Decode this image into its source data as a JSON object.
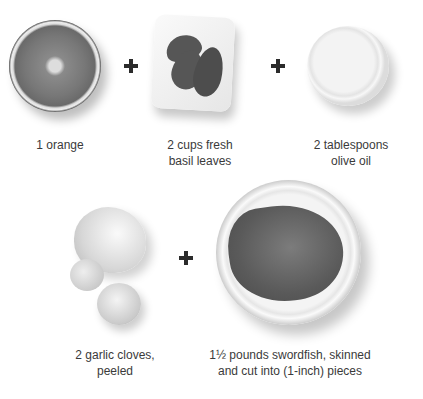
{
  "ingredients": [
    {
      "name": "orange",
      "label_lines": [
        "1 orange"
      ]
    },
    {
      "name": "basil",
      "label_lines": [
        "2 cups fresh",
        "basil leaves"
      ]
    },
    {
      "name": "olive-oil",
      "label_lines": [
        "2 tablespoons",
        "olive oil"
      ]
    },
    {
      "name": "garlic",
      "label_lines": [
        "2 garlic cloves,",
        "peeled"
      ]
    },
    {
      "name": "swordfish",
      "label_lines": [
        "1½ pounds swordfish, skinned",
        "and cut into (1-inch) pieces"
      ]
    }
  ],
  "operators": {
    "plus": "+"
  }
}
